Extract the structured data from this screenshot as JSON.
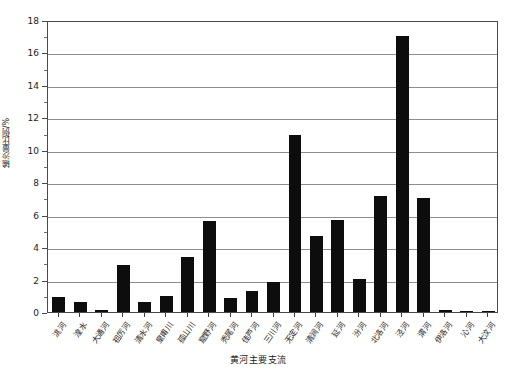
{
  "chart_data": {
    "type": "bar",
    "title": "",
    "xlabel": "黄河主要支流",
    "ylabel": "输沙量比例/%",
    "ylim": [
      0,
      18
    ],
    "ytick_values": [
      0,
      2,
      4,
      6,
      8,
      10,
      12,
      14,
      16,
      18
    ],
    "ytick_labels": [
      "0",
      "2",
      "4",
      "6",
      "8",
      "10",
      "12",
      "14",
      "16",
      "18"
    ],
    "yminor_step": 1,
    "grid": true,
    "grid_axis": "y",
    "legend": false,
    "bar_color": "#0d0d0d",
    "categories": [
      "洮河",
      "湟水",
      "大通河",
      "祖厉河",
      "清水河",
      "皇甫川",
      "孤山川",
      "窟野河",
      "秃尾河",
      "佳芦河",
      "三川河",
      "无定河",
      "清涧河",
      "延河",
      "汾河",
      "北洛河",
      "泾河",
      "渭河",
      "伊洛河",
      "沁河",
      "大汶河"
    ],
    "values": [
      0.9,
      0.6,
      0.15,
      2.9,
      0.6,
      1.0,
      3.4,
      5.6,
      0.85,
      1.3,
      1.85,
      10.9,
      4.7,
      5.65,
      2.05,
      7.15,
      17.0,
      7.05,
      0.15,
      0.07,
      0.02
    ]
  }
}
